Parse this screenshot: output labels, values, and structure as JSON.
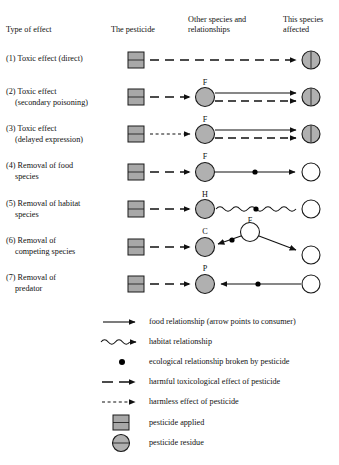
{
  "header": {
    "col1": "Type of effect",
    "col2": "The pesticide",
    "col3_line1": "Other species and",
    "col3_line2": "relationships",
    "col4_line1": "This species",
    "col4_line2": "affected"
  },
  "rows": [
    {
      "num": "(1)",
      "line1": "Toxic effect (direct)",
      "line2": "",
      "mid_label": "",
      "effect": "toxic-direct"
    },
    {
      "num": "(2)",
      "line1": "Toxic effect",
      "line2": "(secondary poisoning)",
      "mid_label": "F",
      "effect": "toxic-secondary-poisoning"
    },
    {
      "num": "(3)",
      "line1": "Toxic effect",
      "line2": "(delayed expression)",
      "mid_label": "F",
      "effect": "toxic-delayed-expression"
    },
    {
      "num": "(4)",
      "line1": "Removal of food",
      "line2": "species",
      "mid_label": "F",
      "effect": "removal-food-species"
    },
    {
      "num": "(5)",
      "line1": "Removal of habitat",
      "line2": "species",
      "mid_label": "H",
      "effect": "removal-habitat-species"
    },
    {
      "num": "(6)",
      "line1": "Removal of",
      "line2": "competing species",
      "mid_label": "C",
      "extra_label": "F",
      "effect": "removal-competing-species"
    },
    {
      "num": "(7)",
      "line1": "Removal of",
      "line2": "predator",
      "mid_label": "P",
      "effect": "removal-predator"
    }
  ],
  "legend": [
    {
      "symbol": "solid-arrow-icon",
      "text": "food relationship (arrow points to consumer)"
    },
    {
      "symbol": "wavy-arrow-icon",
      "text": "habitat relationship"
    },
    {
      "symbol": "black-dot-icon",
      "text": "ecological relationship broken by pesticide"
    },
    {
      "symbol": "dashed-arrow-icon",
      "text": "harmful toxicological effect of pesticide"
    },
    {
      "symbol": "fine-dashed-arrow-icon",
      "text": "harmless effect of pesticide"
    },
    {
      "symbol": "grey-square-icon",
      "text": "pesticide applied"
    },
    {
      "symbol": "grey-circle-icon",
      "text": "pesticide residue"
    }
  ],
  "colors": {
    "pesticide_fill": "#a8a8a8",
    "residue_fill": "#b0b0b0",
    "unaffected_fill": "#ffffff",
    "stroke": "#1a1a1a"
  }
}
